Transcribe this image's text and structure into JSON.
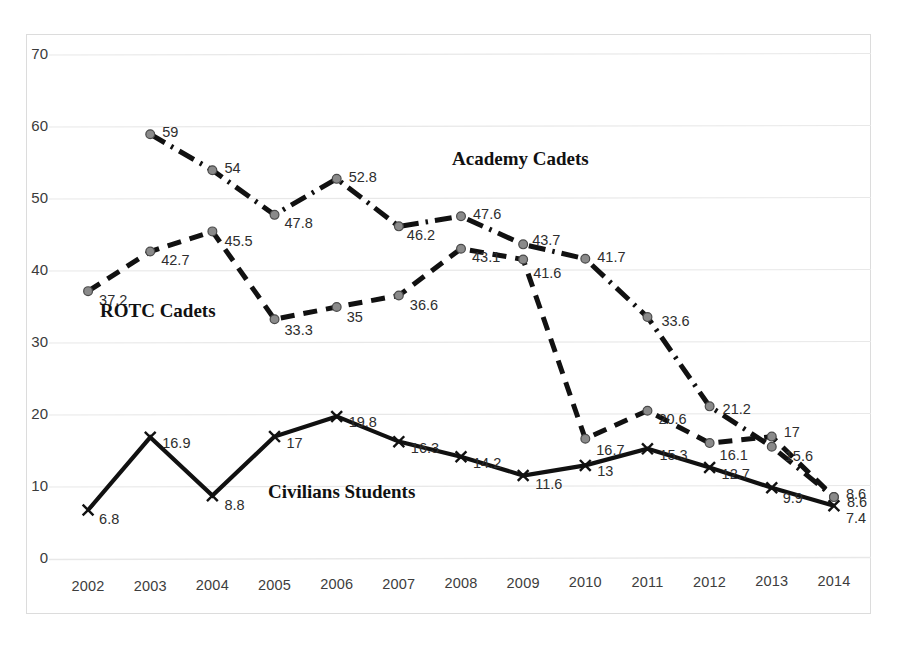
{
  "chart_data": {
    "type": "line",
    "title": "",
    "subtitle": "",
    "xlabel": "",
    "ylabel": "",
    "grid": true,
    "legend_position": "inline-annotations",
    "xlim": [
      2002,
      2014
    ],
    "ylim": [
      0,
      70
    ],
    "ytick_step": 10,
    "categories": [
      "2002",
      "2003",
      "2004",
      "2005",
      "2006",
      "2007",
      "2008",
      "2009",
      "2010",
      "2011",
      "2012",
      "2013",
      "2014"
    ],
    "yticks": [
      "0",
      "10",
      "20",
      "30",
      "40",
      "50",
      "60",
      "70"
    ],
    "series": [
      {
        "name": "Academy Cadets",
        "style": "dash-dot",
        "marker": "circle",
        "color": "#111111",
        "values": [
          null,
          59,
          54,
          47.8,
          52.8,
          46.2,
          47.6,
          43.7,
          41.7,
          33.6,
          21.2,
          15.6,
          8.6
        ],
        "labels": [
          "",
          "59",
          "54",
          "47.8",
          "52.8",
          "46.2",
          "47.6",
          "43.7",
          "41.7",
          "33.6",
          "21.2",
          "15.6",
          "8.6"
        ]
      },
      {
        "name": "ROTC Cadets",
        "style": "dashed",
        "marker": "circle",
        "color": "#111111",
        "values": [
          37.2,
          42.7,
          45.5,
          33.3,
          35,
          36.6,
          43.1,
          41.6,
          16.7,
          20.6,
          16.1,
          17,
          8.6
        ],
        "labels": [
          "37.2",
          "42.7",
          "45.5",
          "33.3",
          "35",
          "36.6",
          "43.1",
          "41.6",
          "16.7",
          "20.6",
          "16.1",
          "17",
          "8.6"
        ]
      },
      {
        "name": "Civilians Students",
        "style": "solid",
        "marker": "x",
        "color": "#111111",
        "values": [
          6.8,
          16.9,
          8.8,
          17,
          19.8,
          16.3,
          14.2,
          11.6,
          13,
          15.3,
          12.7,
          9.9,
          7.4
        ],
        "labels": [
          "6.8",
          "16.9",
          "8.8",
          "17",
          "19.8",
          "16.3",
          "14.2",
          "11.6",
          "13",
          "15.3",
          "12.7",
          "9.9",
          "7.4"
        ]
      }
    ],
    "annotations": [
      {
        "text": "Academy Cadets",
        "x": 2007.6,
        "y": 54.5
      },
      {
        "text": "ROTC Cadets",
        "x": 2002.6,
        "y": 32.0
      },
      {
        "text": "Civilians Students",
        "x": 2005.0,
        "y": 6.6
      }
    ]
  },
  "axis": {
    "yticks": [
      "70",
      "60",
      "50",
      "40",
      "30",
      "20",
      "10",
      "0"
    ],
    "xticks": [
      "2002",
      "2003",
      "2004",
      "2005",
      "2006",
      "2007",
      "2008",
      "2009",
      "2010",
      "2011",
      "2012",
      "2013",
      "2014"
    ]
  },
  "series_labels": {
    "academy": "Academy Cadets",
    "rotc": "ROTC Cadets",
    "civilians": "Civilians Students"
  },
  "colors": {
    "line": "#111111",
    "grid": "#e8e8e8",
    "frame": "#dcdcdc",
    "text": "#2e2e2e"
  }
}
